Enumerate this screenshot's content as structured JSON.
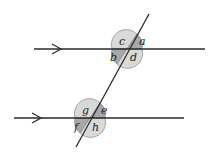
{
  "diagram": {
    "colors": {
      "line": "#2a2a2a",
      "light_sector": "#d9d9d9",
      "dark_sector": "#a8a8a8",
      "background": "#ffffff"
    },
    "top_intersection": {
      "labels": {
        "a": "a",
        "b": "b",
        "c": "c",
        "d": "d"
      }
    },
    "bottom_intersection": {
      "labels": {
        "e": "e",
        "f": "f",
        "g": "g",
        "h": "h"
      }
    },
    "parallel_marks": [
      "arrow-top-line",
      "arrow-bottom-line"
    ]
  }
}
